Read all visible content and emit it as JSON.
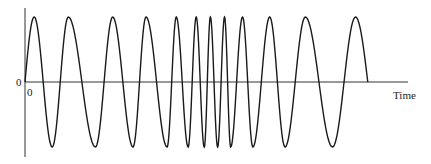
{
  "chart_data": {
    "type": "line",
    "title": "",
    "xlabel": "Time",
    "ylabel": "",
    "y_origin_label": "0",
    "x_origin_label": "0",
    "grid": false,
    "legend": "none",
    "amplitude": 1,
    "ylim": [
      -1.15,
      1.15
    ],
    "xlim": [
      0,
      1.0
    ],
    "wave_end_x": 0.886,
    "extrema": [
      {
        "x": 0.0,
        "y": 0
      },
      {
        "x": 0.024,
        "y": 1
      },
      {
        "x": 0.071,
        "y": -1
      },
      {
        "x": 0.113,
        "y": 1
      },
      {
        "x": 0.184,
        "y": -1
      },
      {
        "x": 0.229,
        "y": 1
      },
      {
        "x": 0.282,
        "y": -1
      },
      {
        "x": 0.316,
        "y": 1
      },
      {
        "x": 0.371,
        "y": -1
      },
      {
        "x": 0.395,
        "y": 1
      },
      {
        "x": 0.426,
        "y": -1
      },
      {
        "x": 0.447,
        "y": 1
      },
      {
        "x": 0.468,
        "y": -1
      },
      {
        "x": 0.484,
        "y": 1
      },
      {
        "x": 0.503,
        "y": -1
      },
      {
        "x": 0.521,
        "y": 1
      },
      {
        "x": 0.537,
        "y": -1
      },
      {
        "x": 0.568,
        "y": 1
      },
      {
        "x": 0.595,
        "y": -1
      },
      {
        "x": 0.639,
        "y": 1
      },
      {
        "x": 0.679,
        "y": -1
      },
      {
        "x": 0.732,
        "y": 1
      },
      {
        "x": 0.803,
        "y": -1
      },
      {
        "x": 0.863,
        "y": 1
      },
      {
        "x": 0.895,
        "y": 0
      }
    ]
  },
  "labels": {
    "y_zero": "0",
    "x_zero": "0",
    "x_axis": "Time"
  },
  "colors": {
    "line": "#1a1a1a",
    "axis": "#333333",
    "background": "#ffffff"
  }
}
